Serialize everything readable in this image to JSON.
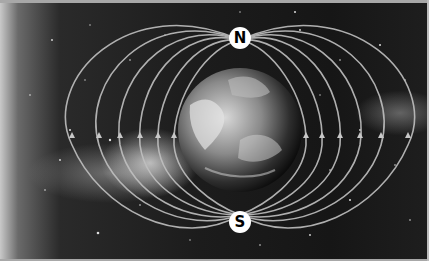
{
  "diagram": {
    "labels": {
      "north": "N",
      "south": "S"
    },
    "colors": {
      "field_lines": "#bdbdbd",
      "pole_badge_bg": "#ffffff",
      "pole_badge_text": "#000000",
      "space_bg": "#1a1a1a"
    },
    "field_line_loops_per_side": 6
  }
}
